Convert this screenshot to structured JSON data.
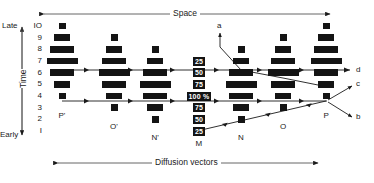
{
  "figure": {
    "top_axis_label": "Space",
    "bottom_axis_label": "Diffusion vectors",
    "left_axis_label": "Time",
    "left_axis_top": "Late",
    "left_axis_bottom": "Early"
  },
  "y_ticks": [
    "IO",
    "9",
    "8",
    "7",
    "6",
    "5",
    "4",
    "3",
    "2",
    "I"
  ],
  "columns": [
    {
      "name": "P'",
      "label": "P'",
      "cx": 62
    },
    {
      "name": "O'",
      "label": "O'",
      "cx": 114
    },
    {
      "name": "N'",
      "label": "N'",
      "cx": 155
    },
    {
      "name": "M",
      "label": "M",
      "cx": 199
    },
    {
      "name": "N",
      "label": "N",
      "cx": 241
    },
    {
      "name": "O",
      "label": "O",
      "cx": 283
    },
    {
      "name": "P",
      "label": "P",
      "cx": 326
    }
  ],
  "center_percent_labels": [
    {
      "row": 7,
      "text": "25"
    },
    {
      "row": 6,
      "text": "50"
    },
    {
      "row": 5,
      "text": "75"
    },
    {
      "row": 4,
      "text": "100 %"
    },
    {
      "row": 3,
      "text": "75"
    },
    {
      "row": 2,
      "text": "50"
    },
    {
      "row": 1,
      "text": "25"
    }
  ],
  "bars": [
    {
      "col": "P'",
      "row": 10,
      "w": 7
    },
    {
      "col": "P'",
      "row": 9,
      "w": 16
    },
    {
      "col": "P'",
      "row": 8,
      "w": 24
    },
    {
      "col": "P'",
      "row": 7,
      "w": 31
    },
    {
      "col": "P'",
      "row": 6,
      "w": 24
    },
    {
      "col": "P'",
      "row": 5,
      "w": 16
    },
    {
      "col": "P'",
      "row": 4,
      "w": 7
    },
    {
      "col": "O'",
      "row": 9,
      "w": 7
    },
    {
      "col": "O'",
      "row": 8,
      "w": 16
    },
    {
      "col": "O'",
      "row": 7,
      "w": 24
    },
    {
      "col": "O'",
      "row": 6,
      "w": 31
    },
    {
      "col": "O'",
      "row": 5,
      "w": 24
    },
    {
      "col": "O'",
      "row": 4,
      "w": 16
    },
    {
      "col": "O'",
      "row": 3,
      "w": 7
    },
    {
      "col": "N'",
      "row": 8,
      "w": 7
    },
    {
      "col": "N'",
      "row": 7,
      "w": 16
    },
    {
      "col": "N'",
      "row": 6,
      "w": 24
    },
    {
      "col": "N'",
      "row": 5,
      "w": 31
    },
    {
      "col": "N'",
      "row": 4,
      "w": 24
    },
    {
      "col": "N'",
      "row": 3,
      "w": 16
    },
    {
      "col": "N'",
      "row": 2,
      "w": 7
    },
    {
      "col": "N",
      "row": 8,
      "w": 7
    },
    {
      "col": "N",
      "row": 7,
      "w": 16
    },
    {
      "col": "N",
      "row": 6,
      "w": 24
    },
    {
      "col": "N",
      "row": 5,
      "w": 31
    },
    {
      "col": "N",
      "row": 4,
      "w": 24
    },
    {
      "col": "N",
      "row": 3,
      "w": 16
    },
    {
      "col": "N",
      "row": 2,
      "w": 7
    },
    {
      "col": "O",
      "row": 9,
      "w": 7
    },
    {
      "col": "O",
      "row": 8,
      "w": 16
    },
    {
      "col": "O",
      "row": 7,
      "w": 24
    },
    {
      "col": "O",
      "row": 6,
      "w": 31
    },
    {
      "col": "O",
      "row": 5,
      "w": 24
    },
    {
      "col": "O",
      "row": 4,
      "w": 16
    },
    {
      "col": "O",
      "row": 3,
      "w": 7
    },
    {
      "col": "P",
      "row": 10,
      "w": 7
    },
    {
      "col": "P",
      "row": 9,
      "w": 16
    },
    {
      "col": "P",
      "row": 8,
      "w": 24
    },
    {
      "col": "P",
      "row": 7,
      "w": 31
    },
    {
      "col": "P",
      "row": 6,
      "w": 24
    },
    {
      "col": "P",
      "row": 5,
      "w": 16
    },
    {
      "col": "P",
      "row": 4,
      "w": 7
    }
  ],
  "vectors": [
    {
      "name": "a",
      "label": "a"
    },
    {
      "name": "b",
      "label": "b"
    },
    {
      "name": "c",
      "label": "c"
    },
    {
      "name": "d",
      "label": "d"
    }
  ],
  "colors": {
    "bar": "#141414",
    "line": "#1a1a1a",
    "text": "#222222",
    "background": "#ffffff"
  }
}
